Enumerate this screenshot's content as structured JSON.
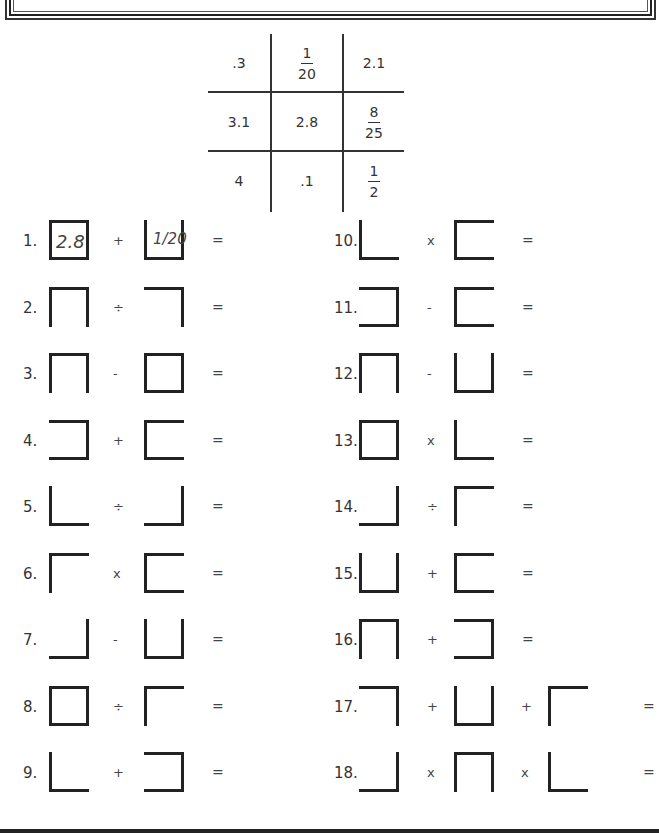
{
  "key_grid": {
    "rows": [
      [
        {
          "type": "num",
          "text": ".3"
        },
        {
          "type": "frac",
          "num": "1",
          "den": "20"
        },
        {
          "type": "num",
          "text": "2.1"
        }
      ],
      [
        {
          "type": "num",
          "text": "3.1"
        },
        {
          "type": "num",
          "text": "2.8"
        },
        {
          "type": "frac",
          "num": "8",
          "den": "25"
        }
      ],
      [
        {
          "type": "num",
          "text": "4"
        },
        {
          "type": "num",
          "text": ".1"
        },
        {
          "type": "frac",
          "num": "1",
          "den": "2"
        }
      ]
    ]
  },
  "problems": [
    {
      "label": "1.",
      "shapes": [
        "full-box",
        "bottom-left-right"
      ],
      "ops": [
        "+"
      ],
      "equals": "=",
      "answers": [
        "2.8",
        "1/20"
      ]
    },
    {
      "label": "2.",
      "shapes": [
        "top-left-right",
        "top-right"
      ],
      "ops": [
        "÷"
      ],
      "equals": "="
    },
    {
      "label": "3.",
      "shapes": [
        "top-left-right",
        "full-box"
      ],
      "ops": [
        "-"
      ],
      "equals": "="
    },
    {
      "label": "4.",
      "shapes": [
        "top-right-bottom",
        "top-left-bottom"
      ],
      "ops": [
        "+"
      ],
      "equals": "="
    },
    {
      "label": "5.",
      "shapes": [
        "left-bottom",
        "right-bottom"
      ],
      "ops": [
        "÷"
      ],
      "equals": "="
    },
    {
      "label": "6.",
      "shapes": [
        "top-left",
        "top-left-bottom"
      ],
      "ops": [
        "x"
      ],
      "equals": "="
    },
    {
      "label": "7.",
      "shapes": [
        "right-bottom",
        "bottom-left-right"
      ],
      "ops": [
        "-"
      ],
      "equals": "="
    },
    {
      "label": "8.",
      "shapes": [
        "full-box",
        "top-left"
      ],
      "ops": [
        "÷"
      ],
      "equals": "="
    },
    {
      "label": "9.",
      "shapes": [
        "left-bottom",
        "top-right-bottom"
      ],
      "ops": [
        "+"
      ],
      "equals": "="
    },
    {
      "label": "10.",
      "shapes": [
        "left-bottom",
        "top-left-bottom"
      ],
      "ops": [
        "x"
      ],
      "equals": "="
    },
    {
      "label": "11.",
      "shapes": [
        "top-right-bottom",
        "top-left-bottom"
      ],
      "ops": [
        "-"
      ],
      "equals": "="
    },
    {
      "label": "12.",
      "shapes": [
        "top-left-right",
        "bottom-left-right"
      ],
      "ops": [
        "-"
      ],
      "equals": "="
    },
    {
      "label": "13.",
      "shapes": [
        "full-box",
        "left-bottom"
      ],
      "ops": [
        "x"
      ],
      "equals": "="
    },
    {
      "label": "14.",
      "shapes": [
        "right-bottom",
        "top-left"
      ],
      "ops": [
        "÷"
      ],
      "equals": "="
    },
    {
      "label": "15.",
      "shapes": [
        "bottom-left-right",
        "top-left-bottom"
      ],
      "ops": [
        "+"
      ],
      "equals": "="
    },
    {
      "label": "16.",
      "shapes": [
        "top-left-right",
        "top-right-bottom"
      ],
      "ops": [
        "+"
      ],
      "equals": "="
    },
    {
      "label": "17.",
      "shapes": [
        "top-right",
        "bottom-left-right",
        "top-left"
      ],
      "ops": [
        "+",
        "+"
      ],
      "equals": "="
    },
    {
      "label": "18.",
      "shapes": [
        "right-bottom",
        "top-left-right",
        "left-bottom"
      ],
      "ops": [
        "x",
        "x"
      ],
      "equals": "="
    }
  ]
}
